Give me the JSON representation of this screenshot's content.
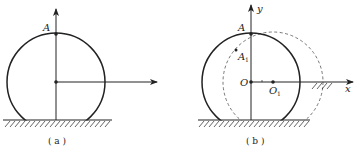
{
  "figure_a": {
    "caption": "( a )",
    "point_label": "A"
  },
  "figure_b": {
    "caption": "( b )",
    "y_axis_label": "y",
    "x_axis_label": "x",
    "point_label": "A",
    "moved_point_label": "A",
    "moved_point_subscript": "1",
    "origin_label": "O",
    "moved_center_label": "O",
    "moved_center_subscript": "1"
  },
  "colors": {
    "stroke": "#222222",
    "dashed": "#666666",
    "background": "#ffffff"
  }
}
